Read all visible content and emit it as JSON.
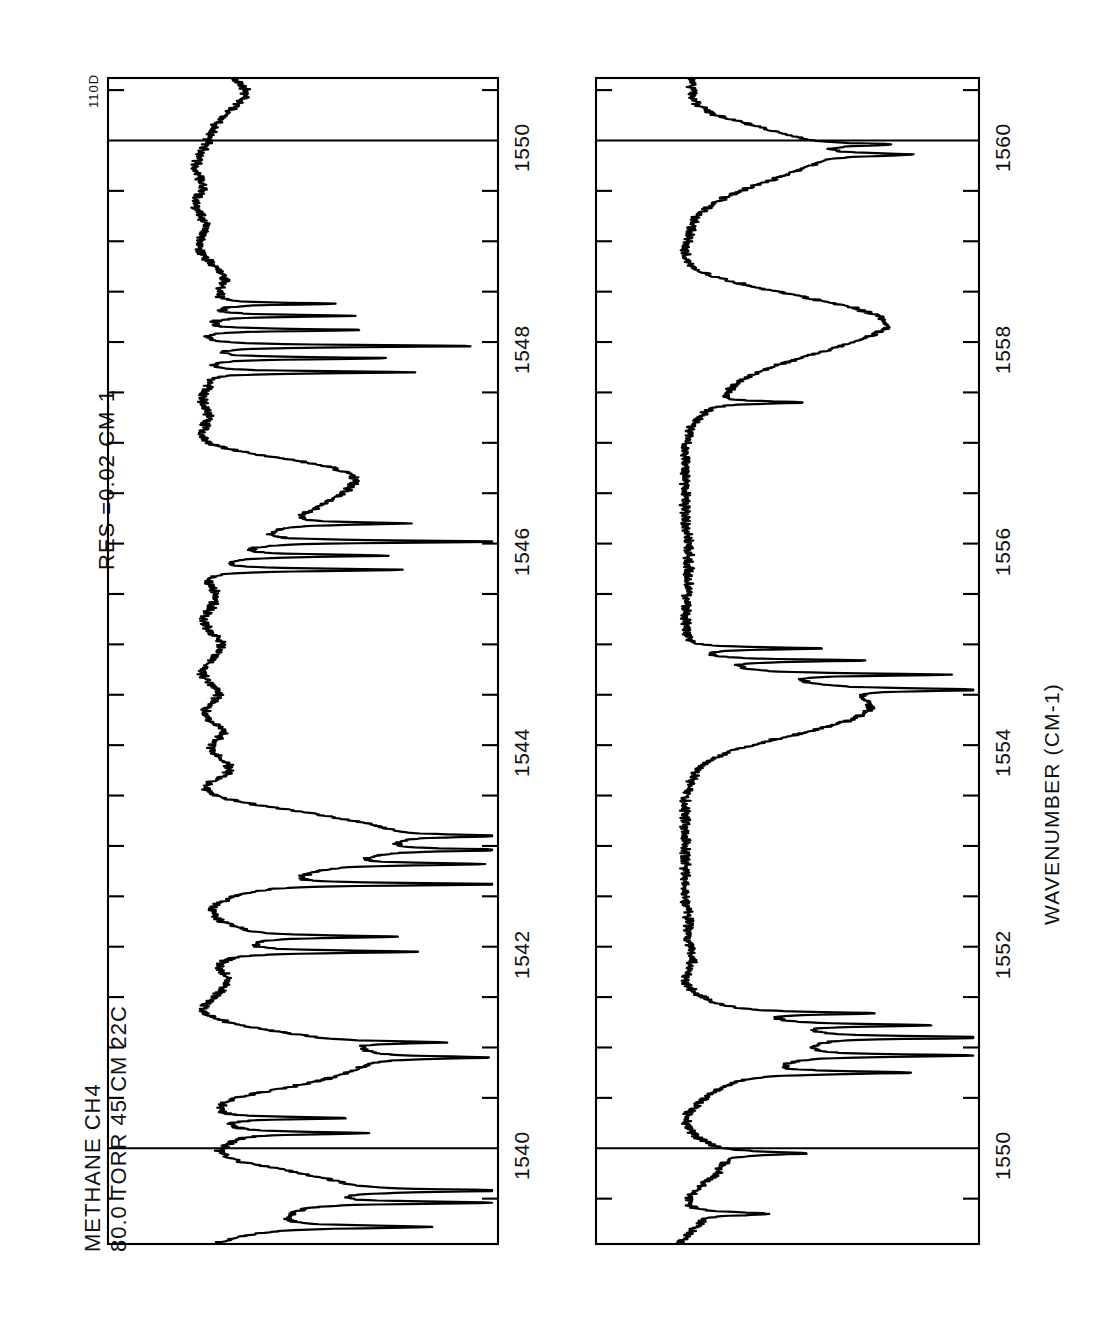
{
  "figure": {
    "corner_code": "110D",
    "header_lines": [
      "METHANE   CH4",
      "80.0 TORR   45 CM  22C"
    ],
    "resolution_label": "RES =0.02  CM-1",
    "axis_title": "WAVENUMBER  (CM-1)",
    "orientation": "rotated-90-ccw",
    "line_color": "#000000",
    "background_color": "#ffffff"
  },
  "chart_data": {
    "type": "line",
    "title": "METHANE   CH4",
    "subtitle": "80.0 TORR   45 CM  22C",
    "annotation": "RES =0.02  CM-1",
    "xlabel": "WAVENUMBER  (CM-1)",
    "ylabel": "TRANSMITTANCE",
    "grid": false,
    "legend": "none",
    "panels": [
      {
        "name": "panel-top",
        "xlim": [
          1539.05,
          1550.62
        ],
        "ticks_major": [
          1540,
          1542,
          1544,
          1546,
          1548,
          1550
        ],
        "tick_labels": [
          "1540",
          "1542",
          "1544",
          "1546",
          "1548",
          "1550"
        ],
        "minor_tick_interval": 0.5,
        "full_width_gridlines": [
          1540,
          1550
        ],
        "ylim": [
          0,
          1
        ],
        "baseline": 1.0,
        "x": [
          1539.05,
          1539.12,
          1539.2,
          1539.28,
          1539.36,
          1539.44,
          1539.5,
          1539.56,
          1539.62,
          1539.68,
          1539.74,
          1539.8,
          1539.86,
          1539.92,
          1539.98,
          1540.04,
          1540.1,
          1540.16,
          1540.22,
          1540.28,
          1540.34,
          1540.4,
          1540.46,
          1540.52,
          1540.58,
          1540.64,
          1540.7,
          1540.76,
          1540.82,
          1540.88,
          1540.94,
          1541.0,
          1541.06,
          1541.12,
          1541.18,
          1541.24,
          1541.3,
          1541.36,
          1541.42,
          1541.48,
          1541.54,
          1541.6,
          1541.66,
          1541.72,
          1541.78,
          1541.84,
          1541.9,
          1541.96,
          1542.02,
          1542.08,
          1542.14,
          1542.2,
          1542.26,
          1542.32,
          1542.38,
          1542.44,
          1542.5,
          1542.56,
          1542.62,
          1542.68,
          1542.74,
          1542.8,
          1542.86,
          1542.92,
          1542.98,
          1543.04,
          1543.1,
          1543.16,
          1543.22,
          1543.28,
          1543.34,
          1543.4,
          1543.46,
          1543.52,
          1543.58,
          1543.64,
          1543.7,
          1543.76,
          1543.82,
          1543.88,
          1543.94,
          1544.0,
          1544.06,
          1544.12,
          1544.18,
          1544.24,
          1544.3,
          1544.36,
          1544.42,
          1544.48,
          1544.54,
          1544.6,
          1544.66,
          1544.72,
          1544.78,
          1544.84,
          1544.9,
          1544.96,
          1545.02,
          1545.08,
          1545.14,
          1545.2,
          1545.26,
          1545.32,
          1545.38,
          1545.44,
          1545.5,
          1545.56,
          1545.62,
          1545.68,
          1545.74,
          1545.8,
          1545.86,
          1545.92,
          1545.98,
          1546.04,
          1546.1,
          1546.16,
          1546.22,
          1546.28,
          1546.34,
          1546.4,
          1546.46,
          1546.52,
          1546.58,
          1546.64,
          1546.7,
          1546.76,
          1546.82,
          1546.88,
          1546.94,
          1547.0,
          1547.06,
          1547.12,
          1547.18,
          1547.24,
          1547.3,
          1547.36,
          1547.42,
          1547.48,
          1547.54,
          1547.6,
          1547.66,
          1547.72,
          1547.78,
          1547.84,
          1547.9,
          1547.96,
          1548.02,
          1548.08,
          1548.14,
          1548.2,
          1548.26,
          1548.32,
          1548.38,
          1548.44,
          1548.5,
          1548.56,
          1548.62,
          1548.68,
          1548.74,
          1548.8,
          1548.86,
          1548.92,
          1548.98,
          1549.04,
          1549.1,
          1549.16,
          1549.22,
          1549.28,
          1549.34,
          1549.4,
          1549.46,
          1549.52,
          1549.58,
          1549.64,
          1549.7,
          1549.76,
          1549.82,
          1549.88,
          1549.94,
          1550.0,
          1550.06,
          1550.12,
          1550.18,
          1550.24,
          1550.3,
          1550.36,
          1550.42,
          1550.48,
          1550.55,
          1550.62
        ],
        "y": [
          0.9,
          0.83,
          0.74,
          0.69,
          0.66,
          0.62,
          0.55,
          0.49,
          0.47,
          0.52,
          0.6,
          0.7,
          0.8,
          0.86,
          0.88,
          0.86,
          0.84,
          0.84,
          0.86,
          0.88,
          0.89,
          0.88,
          0.86,
          0.8,
          0.7,
          0.6,
          0.52,
          0.46,
          0.42,
          0.4,
          0.41,
          0.45,
          0.52,
          0.62,
          0.74,
          0.84,
          0.9,
          0.93,
          0.92,
          0.9,
          0.88,
          0.86,
          0.85,
          0.86,
          0.88,
          0.88,
          0.86,
          0.83,
          0.8,
          0.78,
          0.79,
          0.83,
          0.88,
          0.9,
          0.9,
          0.88,
          0.84,
          0.78,
          0.72,
          0.66,
          0.6,
          0.53,
          0.46,
          0.4,
          0.36,
          0.33,
          0.32,
          0.34,
          0.4,
          0.5,
          0.62,
          0.74,
          0.84,
          0.9,
          0.92,
          0.9,
          0.86,
          0.84,
          0.85,
          0.88,
          0.9,
          0.9,
          0.88,
          0.86,
          0.87,
          0.9,
          0.92,
          0.92,
          0.9,
          0.88,
          0.88,
          0.9,
          0.92,
          0.93,
          0.92,
          0.9,
          0.88,
          0.87,
          0.87,
          0.89,
          0.91,
          0.92,
          0.92,
          0.91,
          0.9,
          0.89,
          0.89,
          0.9,
          0.92,
          0.93,
          0.92,
          0.9,
          0.87,
          0.84,
          0.81,
          0.78,
          0.74,
          0.7,
          0.66,
          0.62,
          0.58,
          0.54,
          0.5,
          0.47,
          0.45,
          0.44,
          0.46,
          0.52,
          0.62,
          0.74,
          0.85,
          0.91,
          0.93,
          0.93,
          0.92,
          0.91,
          0.91,
          0.92,
          0.93,
          0.93,
          0.92,
          0.92,
          0.93,
          0.94,
          0.94,
          0.93,
          0.93,
          0.94,
          0.95,
          0.95,
          0.94,
          0.93,
          0.92,
          0.91,
          0.9,
          0.89,
          0.88,
          0.87,
          0.86,
          0.87,
          0.89,
          0.91,
          0.93,
          0.94,
          0.94,
          0.93,
          0.92,
          0.92,
          0.93,
          0.94,
          0.95,
          0.95,
          0.94,
          0.93,
          0.93,
          0.94,
          0.95,
          0.95,
          0.94,
          0.93,
          0.92,
          0.91,
          0.9,
          0.89,
          0.88,
          0.86,
          0.84,
          0.82,
          0.8,
          0.79,
          0.8,
          0.83,
          0.87,
          0.9,
          0.92,
          0.93,
          0.93,
          0.92
        ],
        "sharp_lines": [
          {
            "center": 1539.22,
            "depth": 0.52,
            "width": 0.035
          },
          {
            "center": 1539.46,
            "depth": 0.6,
            "width": 0.03
          },
          {
            "center": 1539.58,
            "depth": 0.55,
            "width": 0.03
          },
          {
            "center": 1540.15,
            "depth": 0.44,
            "width": 0.03
          },
          {
            "center": 1540.3,
            "depth": 0.42,
            "width": 0.028
          },
          {
            "center": 1540.9,
            "depth": 0.4,
            "width": 0.03
          },
          {
            "center": 1541.05,
            "depth": 0.35,
            "width": 0.028
          },
          {
            "center": 1541.95,
            "depth": 0.6,
            "width": 0.03
          },
          {
            "center": 1542.1,
            "depth": 0.48,
            "width": 0.028
          },
          {
            "center": 1542.62,
            "depth": 0.8,
            "width": 0.028
          },
          {
            "center": 1542.82,
            "depth": 0.48,
            "width": 0.028
          },
          {
            "center": 1542.96,
            "depth": 0.44,
            "width": 0.028
          },
          {
            "center": 1543.1,
            "depth": 0.38,
            "width": 0.028
          },
          {
            "center": 1545.74,
            "depth": 0.62,
            "width": 0.03
          },
          {
            "center": 1545.88,
            "depth": 0.5,
            "width": 0.03
          },
          {
            "center": 1546.02,
            "depth": 0.82,
            "width": 0.028
          },
          {
            "center": 1546.2,
            "depth": 0.4,
            "width": 0.028
          },
          {
            "center": 1547.7,
            "depth": 0.68,
            "width": 0.026
          },
          {
            "center": 1547.84,
            "depth": 0.58,
            "width": 0.026
          },
          {
            "center": 1547.96,
            "depth": 0.88,
            "width": 0.026
          },
          {
            "center": 1548.12,
            "depth": 0.52,
            "width": 0.026
          },
          {
            "center": 1548.26,
            "depth": 0.46,
            "width": 0.026
          },
          {
            "center": 1548.38,
            "depth": 0.38,
            "width": 0.026
          }
        ]
      },
      {
        "name": "panel-bottom",
        "xlim": [
          1549.05,
          1560.62
        ],
        "ticks_major": [
          1550,
          1552,
          1554,
          1556,
          1558,
          1560
        ],
        "tick_labels": [
          "1550",
          "1552",
          "1554",
          "1556",
          "1558",
          "1560"
        ],
        "minor_tick_interval": 0.5,
        "full_width_gridlines": [
          1550,
          1560
        ],
        "ylim": [
          0,
          1
        ],
        "baseline": 1.0,
        "x": [
          1549.05,
          1549.15,
          1549.25,
          1549.35,
          1549.45,
          1549.55,
          1549.65,
          1549.75,
          1549.85,
          1549.95,
          1550.05,
          1550.15,
          1550.25,
          1550.35,
          1550.45,
          1550.55,
          1550.65,
          1550.75,
          1550.85,
          1550.95,
          1551.05,
          1551.15,
          1551.25,
          1551.35,
          1551.45,
          1551.55,
          1551.65,
          1551.75,
          1551.85,
          1551.95,
          1552.05,
          1552.15,
          1552.25,
          1552.35,
          1552.45,
          1552.55,
          1552.65,
          1552.75,
          1552.85,
          1552.95,
          1553.05,
          1553.15,
          1553.25,
          1553.35,
          1553.45,
          1553.55,
          1553.65,
          1553.75,
          1553.85,
          1553.95,
          1554.05,
          1554.15,
          1554.25,
          1554.35,
          1554.45,
          1554.55,
          1554.65,
          1554.75,
          1554.85,
          1554.95,
          1555.05,
          1555.15,
          1555.25,
          1555.35,
          1555.45,
          1555.55,
          1555.65,
          1555.75,
          1555.85,
          1555.95,
          1556.05,
          1556.15,
          1556.25,
          1556.35,
          1556.45,
          1556.55,
          1556.65,
          1556.75,
          1556.85,
          1556.95,
          1557.05,
          1557.15,
          1557.25,
          1557.35,
          1557.45,
          1557.55,
          1557.65,
          1557.75,
          1557.85,
          1557.95,
          1558.05,
          1558.15,
          1558.25,
          1558.35,
          1558.45,
          1558.55,
          1558.65,
          1558.75,
          1558.85,
          1558.95,
          1559.05,
          1559.15,
          1559.25,
          1559.35,
          1559.45,
          1559.55,
          1559.65,
          1559.75,
          1559.85,
          1559.95,
          1560.05,
          1560.15,
          1560.25,
          1560.35,
          1560.45,
          1560.55,
          1560.62
        ],
        "y": [
          0.96,
          0.93,
          0.9,
          0.92,
          0.94,
          0.92,
          0.88,
          0.84,
          0.82,
          0.84,
          0.88,
          0.92,
          0.94,
          0.93,
          0.9,
          0.86,
          0.8,
          0.72,
          0.64,
          0.58,
          0.55,
          0.58,
          0.66,
          0.76,
          0.86,
          0.92,
          0.94,
          0.93,
          0.92,
          0.92,
          0.93,
          0.93,
          0.93,
          0.93,
          0.94,
          0.94,
          0.94,
          0.94,
          0.94,
          0.94,
          0.94,
          0.94,
          0.94,
          0.94,
          0.94,
          0.93,
          0.92,
          0.9,
          0.86,
          0.78,
          0.66,
          0.52,
          0.4,
          0.34,
          0.36,
          0.46,
          0.62,
          0.78,
          0.88,
          0.93,
          0.94,
          0.94,
          0.94,
          0.94,
          0.94,
          0.93,
          0.93,
          0.93,
          0.93,
          0.93,
          0.93,
          0.94,
          0.94,
          0.94,
          0.94,
          0.94,
          0.94,
          0.94,
          0.94,
          0.94,
          0.93,
          0.92,
          0.9,
          0.87,
          0.83,
          0.79,
          0.74,
          0.66,
          0.56,
          0.44,
          0.34,
          0.28,
          0.3,
          0.4,
          0.56,
          0.72,
          0.85,
          0.92,
          0.94,
          0.94,
          0.93,
          0.92,
          0.9,
          0.86,
          0.8,
          0.72,
          0.62,
          0.54,
          0.5,
          0.52,
          0.6,
          0.72,
          0.84,
          0.9,
          0.92,
          0.92,
          0.92
        ],
        "sharp_lines": [
          {
            "center": 1549.35,
            "depth": 0.25,
            "width": 0.04
          },
          {
            "center": 1549.95,
            "depth": 0.3,
            "width": 0.04
          },
          {
            "center": 1550.75,
            "depth": 0.52,
            "width": 0.035
          },
          {
            "center": 1550.92,
            "depth": 0.6,
            "width": 0.03
          },
          {
            "center": 1551.1,
            "depth": 0.68,
            "width": 0.03
          },
          {
            "center": 1551.22,
            "depth": 0.48,
            "width": 0.03
          },
          {
            "center": 1551.34,
            "depth": 0.42,
            "width": 0.03
          },
          {
            "center": 1554.55,
            "depth": 0.55,
            "width": 0.028
          },
          {
            "center": 1554.7,
            "depth": 0.62,
            "width": 0.028
          },
          {
            "center": 1554.84,
            "depth": 0.5,
            "width": 0.028
          },
          {
            "center": 1554.96,
            "depth": 0.44,
            "width": 0.028
          },
          {
            "center": 1557.4,
            "depth": 0.3,
            "width": 0.03
          },
          {
            "center": 1559.86,
            "depth": 0.3,
            "width": 0.035
          },
          {
            "center": 1559.96,
            "depth": 0.26,
            "width": 0.03
          }
        ]
      }
    ]
  },
  "panel_geometry": {
    "top": {
      "x": 108,
      "y": 78,
      "w": 390,
      "h": 1166
    },
    "bottom": {
      "x": 596,
      "y": 78,
      "w": 383,
      "h": 1166
    }
  }
}
